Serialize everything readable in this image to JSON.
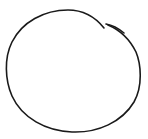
{
  "sketch": {
    "shape": "hand-drawn-circle",
    "stroke_color": "#1a1a1a",
    "background_color": "#ffffff",
    "stroke_width": 1.6,
    "segments": {
      "main_arc": "M104,28 C96,18 84,10 68,10 C44,10 22,22 12,42 C4,58 5,80 12,96 C22,118 46,131 72,132 C98,133 122,122 134,102 C143,86 141,64 136,52 C130,40 120,30 108,25",
      "overlap_tick": "M106,24 C112,25 118,28 124,33"
    }
  }
}
